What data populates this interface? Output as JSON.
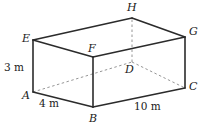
{
  "figure": {
    "type": "geometry-diagram",
    "shape": "cuboid",
    "canvas": {
      "width": 204,
      "height": 128,
      "background": "#ffffff"
    },
    "stroke": {
      "solid_color": "#2b2b2b",
      "hidden_color": "#8a8a8a",
      "solid_width": 1.6,
      "hidden_width": 0.9,
      "hidden_dash": "2.5 2.5"
    },
    "vertices": [
      {
        "id": "E",
        "label": "E",
        "x": 33,
        "y": 40,
        "label_x": 22,
        "label_y": 33,
        "hidden": false
      },
      {
        "id": "A",
        "label": "A",
        "x": 33,
        "y": 92,
        "label_x": 22,
        "label_y": 90,
        "hidden": false
      },
      {
        "id": "F",
        "label": "F",
        "x": 93,
        "y": 57,
        "label_x": 88,
        "label_y": 43,
        "hidden": false
      },
      {
        "id": "B",
        "label": "B",
        "x": 93,
        "y": 107,
        "label_x": 89,
        "label_y": 113,
        "hidden": false
      },
      {
        "id": "G",
        "label": "G",
        "x": 185,
        "y": 37,
        "label_x": 189,
        "label_y": 26,
        "hidden": false
      },
      {
        "id": "C",
        "label": "C",
        "x": 185,
        "y": 88,
        "label_x": 189,
        "label_y": 81,
        "hidden": false
      },
      {
        "id": "H",
        "label": "H",
        "x": 132,
        "y": 18,
        "label_x": 127,
        "label_y": 2,
        "hidden": false
      },
      {
        "id": "D",
        "label": "D",
        "x": 132,
        "y": 62,
        "label_x": 125,
        "label_y": 64,
        "hidden": true
      }
    ],
    "edges_solid": [
      {
        "from": "E",
        "to": "F",
        "name": "edge-EF"
      },
      {
        "from": "F",
        "to": "G",
        "name": "edge-FG"
      },
      {
        "from": "E",
        "to": "H",
        "name": "edge-EH"
      },
      {
        "from": "H",
        "to": "G",
        "name": "edge-HG"
      },
      {
        "from": "E",
        "to": "A",
        "name": "edge-EA"
      },
      {
        "from": "F",
        "to": "B",
        "name": "edge-FB"
      },
      {
        "from": "G",
        "to": "C",
        "name": "edge-GC"
      },
      {
        "from": "A",
        "to": "B",
        "name": "edge-AB"
      },
      {
        "from": "B",
        "to": "C",
        "name": "edge-BC"
      }
    ],
    "edges_hidden": [
      {
        "from": "A",
        "to": "D",
        "name": "edge-AD"
      },
      {
        "from": "D",
        "to": "C",
        "name": "edge-DC"
      },
      {
        "from": "D",
        "to": "H",
        "name": "edge-DH"
      }
    ],
    "dimensions": [
      {
        "id": "height",
        "value": "3",
        "unit": "m",
        "text": "3 m",
        "edge": "EA",
        "x": 4,
        "y": 62
      },
      {
        "id": "width",
        "value": "4",
        "unit": "m",
        "text": "4 m",
        "edge": "AB",
        "x": 39,
        "y": 98
      },
      {
        "id": "length",
        "value": "10",
        "unit": "m",
        "text": "10 m",
        "edge": "BC",
        "x": 134,
        "y": 101
      }
    ]
  }
}
